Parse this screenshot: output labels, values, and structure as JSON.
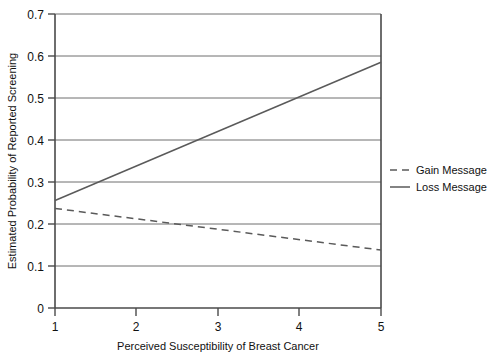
{
  "chart_data": {
    "type": "line",
    "title": "",
    "xlabel": "Perceived Susceptibility of Breast Cancer",
    "ylabel": "Estimated Probability of Reported Screening",
    "xlim": [
      1,
      5
    ],
    "ylim": [
      0,
      0.7
    ],
    "xticks": [
      "1",
      "2",
      "3",
      "4",
      "5"
    ],
    "yticks": [
      "0",
      "0.1",
      "0.2",
      "0.3",
      "0.4",
      "0.5",
      "0.6",
      "0.7"
    ],
    "xtick_values": [
      1,
      2,
      3,
      4,
      5
    ],
    "ytick_values": [
      0,
      0.1,
      0.2,
      0.3,
      0.4,
      0.5,
      0.6,
      0.7
    ],
    "grid": "horizontal",
    "legend_position": "right",
    "x": [
      1,
      5
    ],
    "series": [
      {
        "name": "Gain Message",
        "style": "dashed",
        "color": "#5a5a5a",
        "values": [
          0.237,
          0.138
        ]
      },
      {
        "name": "Loss Message",
        "style": "solid",
        "color": "#5a5a5a",
        "values": [
          0.256,
          0.585
        ]
      }
    ],
    "annotations": []
  },
  "legend": {
    "items": [
      {
        "label": "Gain Message",
        "style": "dashed"
      },
      {
        "label": "Loss Message",
        "style": "solid"
      }
    ]
  },
  "axes": {
    "x_label": "Perceived Susceptibility of Breast Cancer",
    "y_label": "Estimated Probability of Reported Screening",
    "y_ticks": [
      "0.7",
      "0.6",
      "0.5",
      "0.4",
      "0.3",
      "0.2",
      "0.1",
      "0"
    ],
    "x_ticks": [
      "1",
      "2",
      "3",
      "4",
      "5"
    ]
  }
}
